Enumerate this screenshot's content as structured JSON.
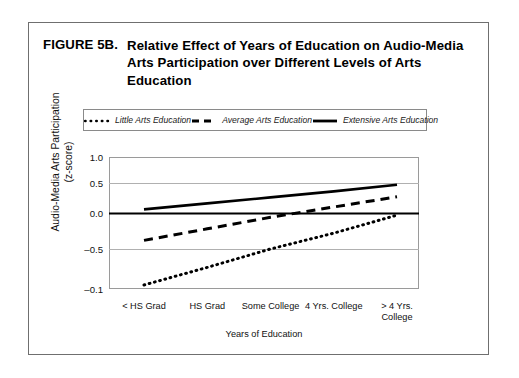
{
  "figure": {
    "number": "FIGURE 5B.",
    "title": "Relative Effect of Years of Education on Audio-Media Arts Participation over Different Levels of Arts Education"
  },
  "chart_data": {
    "type": "line",
    "title": "Relative Effect of Years of Education on Audio-Media Arts Participation over Different Levels of Arts Education",
    "xlabel": "Years of Education",
    "ylabel": "Audio-Media Arts Participation (z-score)",
    "categories": [
      "< HS Grad",
      "HS Grad",
      "Some College",
      "4 Yrs. College",
      "> 4 Yrs. College"
    ],
    "ytick_labels": [
      "1.0",
      "0.5",
      "0.0",
      "-0.5",
      "-0.1"
    ],
    "ytick_values": [
      1.0,
      0.5,
      0.0,
      -0.5,
      -1.0
    ],
    "ylim": [
      -1.0,
      1.0
    ],
    "grid": true,
    "legend_position": "top",
    "zero_line": true,
    "series": [
      {
        "name": "Little Arts Education",
        "style": "dotted",
        "values": [
          -0.95,
          -0.73,
          -0.5,
          -0.28,
          -0.03
        ]
      },
      {
        "name": "Average Arts Education",
        "style": "dashed",
        "values": [
          -0.38,
          -0.22,
          -0.06,
          0.1,
          0.27
        ]
      },
      {
        "name": "Extensive Arts Education",
        "style": "solid",
        "values": [
          0.06,
          0.16,
          0.26,
          0.36,
          0.47
        ]
      }
    ]
  },
  "legend": {
    "items": [
      {
        "label": "Little Arts Education",
        "style": "dotted"
      },
      {
        "label": "Average Arts Education",
        "style": "dashed"
      },
      {
        "label": "Extensive Arts Education",
        "style": "solid"
      }
    ]
  },
  "axes": {
    "y_title_main": "Audio-Media Arts Participation",
    "y_title_sub": "(z-score)",
    "x_title": "Years of Education"
  }
}
